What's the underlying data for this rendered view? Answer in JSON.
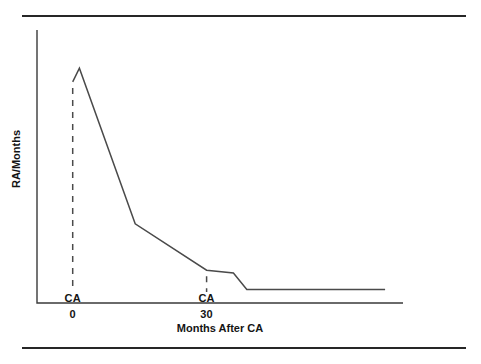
{
  "figure": {
    "has_top_rule": true,
    "has_bottom_rule": true,
    "rule_color": "#262626",
    "background": "#ffffff"
  },
  "chart_data": {
    "type": "line",
    "title": "",
    "subtitle": "",
    "xlabel": "Months After CA",
    "ylabel": "RA/Months",
    "grid": false,
    "legend": null,
    "axis_color": "#3a3a3a",
    "line_color": "#4a4a4a",
    "xlim": [
      -8,
      74
    ],
    "ylim": [
      0,
      100
    ],
    "xticks": [
      {
        "value": 0,
        "label": "0"
      },
      {
        "value": 30,
        "label": "30"
      }
    ],
    "yticks": [],
    "series": [
      {
        "name": "RA/Months",
        "x": [
          0,
          1.5,
          14,
          30,
          36,
          39,
          70
        ],
        "values": [
          81,
          86,
          29,
          12,
          11,
          5,
          5
        ],
        "points": [
          {
            "x": 0,
            "y": 81,
            "note": "pre-rise baseline at first CA"
          },
          {
            "x": 1.5,
            "y": 86,
            "note": "peak immediately after CA"
          },
          {
            "x": 14,
            "y": 29,
            "note": "knee, rapid decline ends"
          },
          {
            "x": 30,
            "y": 12,
            "note": "value at second CA"
          },
          {
            "x": 36,
            "y": 11,
            "note": "brief plateau"
          },
          {
            "x": 39,
            "y": 5,
            "note": "step drop"
          },
          {
            "x": 70,
            "y": 5,
            "note": "flat tail to right edge"
          }
        ]
      }
    ],
    "annotations": [
      {
        "name": "event-ca-first",
        "x": 0,
        "label": "CA",
        "style": "dashed-vertical"
      },
      {
        "name": "event-ca-second",
        "x": 30,
        "label": "CA",
        "style": "dashed-vertical"
      }
    ]
  }
}
